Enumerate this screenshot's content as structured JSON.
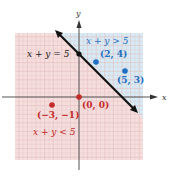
{
  "chart_data": {
    "type": "scatter",
    "title": "",
    "xlabel": "x",
    "ylabel": "y",
    "xlim": [
      -7.4,
      7.4
    ],
    "ylim": [
      -7.4,
      7.4
    ],
    "grid": true,
    "boundary_line": {
      "equation": "x + y = 5",
      "label": "x + y = 5",
      "slope": -1,
      "intercept": 5,
      "style": "solid"
    },
    "regions": [
      {
        "label": "x + y > 5",
        "inequality": "x + y > 5",
        "color": "#d6ebf5"
      },
      {
        "label": "x + y < 5",
        "inequality": "x + y < 5",
        "color": "#f5dede"
      }
    ],
    "points": [
      {
        "x": 2,
        "y": 4,
        "label": "(2, 4)",
        "color": "#1f6fc2"
      },
      {
        "x": 5,
        "y": 3,
        "label": "(5, 3)",
        "color": "#1f6fc2"
      },
      {
        "x": 0,
        "y": 0,
        "label": "(0, 0)",
        "color": "#c42a2a"
      },
      {
        "x": -3,
        "y": -1,
        "label": "(-3, -1)",
        "color": "#c42a2a"
      }
    ],
    "intercept_points": [
      {
        "x": 0,
        "y": 5
      }
    ]
  },
  "labels": {
    "x_axis": "x",
    "y_axis": "y",
    "line": "x + y = 5",
    "region_above": "x + y > 5",
    "region_below": "x + y < 5",
    "p1": "(2, 4)",
    "p2": "(5, 3)",
    "p3": "(0, 0)",
    "p4": "(−3, −1)"
  },
  "colors": {
    "pink_region": "#f5dede",
    "blue_region": "#d6ebf5",
    "grid_pink": "#e6bcbc",
    "grid_blue": "#a9cfe3",
    "line": "#111111",
    "blue_text": "#1f6fc2",
    "red_text": "#c42a2a"
  }
}
